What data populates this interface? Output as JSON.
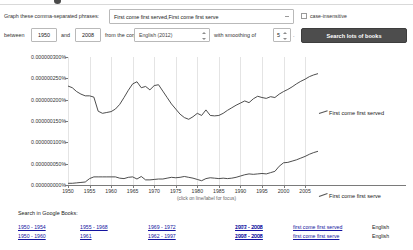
{
  "form": {
    "lead_label": "Graph these comma-separated phrases:",
    "phrase_value": "First come first served,First come first serve",
    "case_insensitive_label": "case-insensitive",
    "case_insensitive_checked": false,
    "between_label": "between",
    "year_start": "1950",
    "and_label": "and",
    "year_end": "2008",
    "corpus_label": "from the corpus",
    "corpus_value": "English (2012)",
    "smoothing_label": "with smoothing of",
    "smoothing_value": "5",
    "smoothing_suffix": ".",
    "search_button": "Search lots of books"
  },
  "chart_caption": "(click on line/label for focus)",
  "footer": {
    "heading": "Search in Google Books:",
    "rows": [
      {
        "ranges": [
          "1950 - 1954",
          "1955 - 1968",
          "1969 - 1972",
          "1973 - 2008",
          "2007 - 2008"
        ],
        "phrase": "first come first served",
        "lang": "English"
      },
      {
        "ranges": [
          "1950 - 1960",
          "1961",
          "1962 - 1997",
          "1998 - 2008",
          "2007 - 2008"
        ],
        "phrase": "first come first serve",
        "lang": "English"
      }
    ]
  },
  "chart_data": {
    "type": "line",
    "title": "",
    "xlabel": "",
    "ylabel": "",
    "grid": true,
    "legend_position": "right-inline",
    "xlim": [
      1950,
      2008
    ],
    "ylim": [
      0,
      3e-07
    ],
    "ytick_labels": [
      "0.000000000%",
      "0.000000050%",
      "0.000000100%",
      "0.000000150%",
      "0.000000200%",
      "0.000000250%",
      "0.000000300%"
    ],
    "ytick_values": [
      0,
      5e-08,
      1e-07,
      1.5e-07,
      2e-07,
      2.5e-07,
      3e-07
    ],
    "xtick_labels": [
      "1950",
      "1955",
      "1960",
      "1965",
      "1970",
      "1975",
      "1980",
      "1985",
      "1990",
      "1995",
      "2000",
      "2005"
    ],
    "xtick_values": [
      1950,
      1955,
      1960,
      1965,
      1970,
      1975,
      1980,
      1985,
      1990,
      1995,
      2000,
      2005
    ],
    "x": [
      1950,
      1951,
      1952,
      1953,
      1954,
      1955,
      1956,
      1957,
      1958,
      1959,
      1960,
      1961,
      1962,
      1963,
      1964,
      1965,
      1966,
      1967,
      1968,
      1969,
      1970,
      1971,
      1972,
      1973,
      1974,
      1975,
      1976,
      1977,
      1978,
      1979,
      1980,
      1981,
      1982,
      1983,
      1984,
      1985,
      1986,
      1987,
      1988,
      1989,
      1990,
      1991,
      1992,
      1993,
      1994,
      1995,
      1996,
      1997,
      1998,
      1999,
      2000,
      2001,
      2002,
      2003,
      2004,
      2005,
      2006,
      2007,
      2008
    ],
    "series": [
      {
        "name": "First come first served",
        "color": "#3a3a3a",
        "values": [
          2.32e-07,
          2.28e-07,
          2.19e-07,
          2.13e-07,
          2.09e-07,
          2.09e-07,
          2.06e-07,
          1.73e-07,
          1.68e-07,
          1.7e-07,
          1.72e-07,
          1.78e-07,
          1.89e-07,
          2.05e-07,
          2.22e-07,
          2.37e-07,
          2.42e-07,
          2.28e-07,
          2.31e-07,
          2.23e-07,
          2.33e-07,
          2.35e-07,
          2.2e-07,
          2.05e-07,
          1.9e-07,
          1.78e-07,
          1.66e-07,
          1.58e-07,
          1.54e-07,
          1.6e-07,
          1.68e-07,
          1.63e-07,
          1.76e-07,
          1.63e-07,
          1.62e-07,
          1.63e-07,
          1.68e-07,
          1.75e-07,
          1.81e-07,
          1.87e-07,
          1.92e-07,
          1.97e-07,
          1.93e-07,
          2.02e-07,
          2.08e-07,
          2.05e-07,
          2.03e-07,
          2.07e-07,
          2.05e-07,
          2.13e-07,
          2.19e-07,
          2.24e-07,
          2.3e-07,
          2.37e-07,
          2.43e-07,
          2.48e-07,
          2.54e-07,
          2.58e-07,
          2.61e-07
        ]
      },
      {
        "name": "First come first serve",
        "color": "#3a3a3a",
        "values": [
          4e-09,
          4e-09,
          5e-09,
          6e-09,
          7e-09,
          1.5e-08,
          1.9e-08,
          1.9e-08,
          1.9e-08,
          1.9e-08,
          1.9e-08,
          1.9e-08,
          1.6e-08,
          1.5e-08,
          1.8e-08,
          1.9e-08,
          1.4e-08,
          2e-08,
          1.2e-08,
          1.2e-08,
          1.3e-08,
          1.4e-08,
          1.4e-08,
          1.6e-08,
          1.8e-08,
          1.7e-08,
          1.8e-08,
          2e-08,
          1.8e-08,
          1.6e-08,
          1.3e-08,
          1e-08,
          1.5e-08,
          1.7e-08,
          1.6e-08,
          1.5e-08,
          1.6e-08,
          1.5e-08,
          1.6e-08,
          1.8e-08,
          2.1e-08,
          2.4e-08,
          2.6e-08,
          2.5e-08,
          2.6e-08,
          2.7e-08,
          2.6e-08,
          2.9e-08,
          3.2e-08,
          4.4e-08,
          5.2e-08,
          5.3e-08,
          5.6e-08,
          5.9e-08,
          6.3e-08,
          6.7e-08,
          7.2e-08,
          7.6e-08,
          7.9e-08
        ]
      }
    ]
  }
}
